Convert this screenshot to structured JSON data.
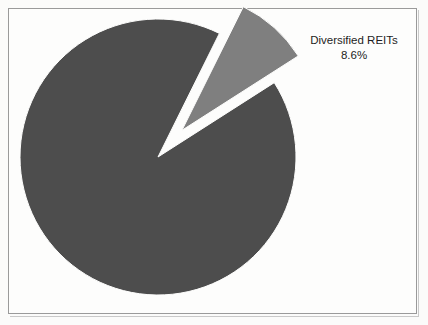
{
  "figure": {
    "background_color": "#fbfbfa",
    "plot_background_color": "#fdfdfc",
    "frame_color": "#9a9a9a"
  },
  "annotation": {
    "label": "Diversified REITs",
    "value_label": "8.6%"
  },
  "chart_data": {
    "type": "pie",
    "title": "",
    "subtitle": "",
    "xlabel": "",
    "ylabel": "",
    "grid": false,
    "legend_position": "none",
    "labels_position": "outside-right",
    "units": "percent",
    "start_angle_deg": 0,
    "direction": "clockwise",
    "categories": [
      "Other REITs",
      "Diversified REITs"
    ],
    "values": [
      91.4,
      8.6
    ],
    "colors": [
      "#4d4d4d",
      "#7f7f7f"
    ],
    "exploded": [
      false,
      true
    ],
    "explode_offset_fraction": 0.26,
    "slices": [
      {
        "name": "Other REITs",
        "value": 91.4,
        "color": "#4d4d4d",
        "exploded": false,
        "labeled": false,
        "start_angle_deg": 57.4,
        "end_angle_deg": 386.4
      },
      {
        "name": "Diversified REITs",
        "value": 8.6,
        "color": "#7f7f7f",
        "exploded": true,
        "labeled": true,
        "data_label": "Diversified REITs 8.6%",
        "start_angle_deg": 26.4,
        "end_angle_deg": 57.4
      }
    ],
    "geometry": {
      "center_x": 158,
      "center_y": 157,
      "radius": 138
    }
  }
}
